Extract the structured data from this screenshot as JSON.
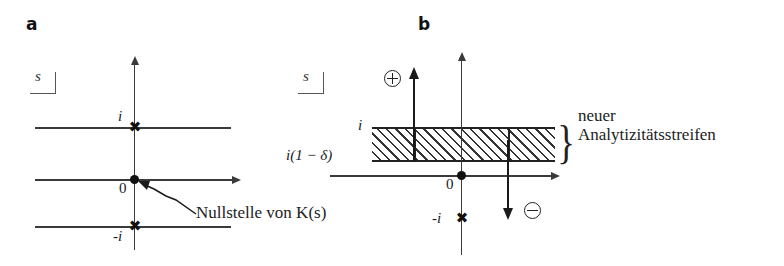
{
  "figure": {
    "panels": [
      {
        "letter": "a",
        "plane_label": "s",
        "axis_labels": {
          "upper": "i",
          "origin": "0",
          "lower": "-i"
        },
        "markers": [
          {
            "name": "pole-upper",
            "symbol": "✖",
            "value": "i"
          },
          {
            "name": "zero-origin",
            "symbol": "●",
            "value": "0"
          },
          {
            "name": "pole-lower",
            "symbol": "✖",
            "value": "-i"
          }
        ],
        "annotation": "Nullstelle von  K(s)"
      },
      {
        "letter": "b",
        "plane_label": "s",
        "axis_labels": {
          "upper": "i",
          "delta": "i(1 − δ)",
          "origin": "0",
          "lower": "-i"
        },
        "markers": [
          {
            "name": "pole-lower",
            "symbol": "✖",
            "value": "-i"
          },
          {
            "name": "zero-origin",
            "symbol": "●",
            "value": "0"
          }
        ],
        "flow": {
          "plus_symbol": "⊕",
          "minus_symbol": "⊖"
        },
        "brace": "}",
        "strip_caption_line1": "neuer",
        "strip_caption_line2": "Analytizitätsstreifen"
      }
    ]
  },
  "colors": {
    "ink": "#1a1a1a",
    "line": "#3a3a3a",
    "hatch": "#333333",
    "paper": "#ffffff"
  }
}
